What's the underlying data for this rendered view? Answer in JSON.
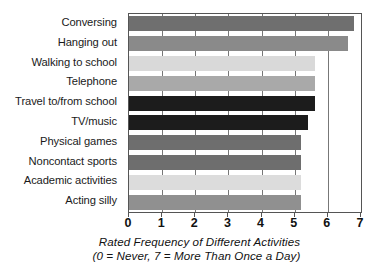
{
  "chart_data": {
    "type": "bar",
    "orientation": "horizontal",
    "title": "",
    "xlabel": "Rated Frequency of Different Activities",
    "ylabel": "",
    "xlim": [
      0,
      7
    ],
    "grid": true,
    "legend": false,
    "categories": [
      "Conversing",
      "Hanging out",
      "Walking to school",
      "Telephone",
      "Travel to/from school",
      "TV/music",
      "Physical games",
      "Noncontact sports",
      "Academic activities",
      "Acting silly"
    ],
    "values": [
      6.8,
      6.6,
      5.6,
      5.6,
      5.6,
      5.4,
      5.2,
      5.2,
      5.2,
      5.2
    ],
    "bar_colors": [
      "#6f6f6f",
      "#8a8a8a",
      "#d9d9d9",
      "#a9a9a9",
      "#1c1c1c",
      "#1c1c1c",
      "#6e6e6e",
      "#6e6e6e",
      "#dcdcdc",
      "#909090"
    ],
    "xticks": [
      0,
      1,
      2,
      3,
      4,
      5,
      6,
      7
    ],
    "xtick_labels": [
      "0",
      "1",
      "2",
      "3",
      "4",
      "5",
      "6",
      "7"
    ],
    "axis_color": "#555555",
    "gridline_color": "#777777",
    "background_color": "#ffffff"
  },
  "caption": {
    "line1": "Rated Frequency of Different Activities",
    "line2": "(0 = Never,  7 = More Than Once a Day)"
  }
}
